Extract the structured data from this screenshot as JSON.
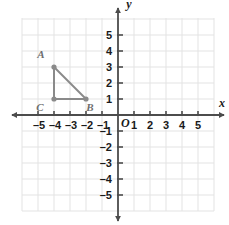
{
  "chart_data": {
    "type": "scatter",
    "title": "",
    "xlabel": "x",
    "ylabel": "y",
    "xlim": [
      -5.8,
      6.1
    ],
    "ylim": [
      -6.1,
      6.3
    ],
    "grid": true,
    "legend": "none",
    "x_ticks": [
      -5,
      -4,
      -3,
      -2,
      -1,
      1,
      2,
      3,
      4,
      5
    ],
    "y_ticks": [
      -5,
      -4,
      -3,
      -2,
      -1,
      1,
      2,
      3,
      4,
      5
    ],
    "x_tick_labels": [
      "–5",
      "–4",
      "–3",
      "–2",
      "–1",
      "1",
      "2",
      "3",
      "4",
      "5"
    ],
    "y_tick_labels": [
      "–5",
      "–4",
      "–3",
      "–2",
      "–1",
      "1",
      "2",
      "3",
      "4",
      "5"
    ],
    "origin_label": "O",
    "points": [
      {
        "name": "A",
        "x": -4,
        "y": 3,
        "label": "A",
        "label_dx": -13,
        "label_dy": -9
      },
      {
        "name": "B",
        "x": -2,
        "y": 1,
        "label": "B",
        "label_dx": 4,
        "label_dy": 12
      },
      {
        "name": "C",
        "x": -4,
        "y": 1,
        "label": "C",
        "label_dx": -14,
        "label_dy": 12
      }
    ],
    "segments": [
      {
        "from": "A",
        "to": "C"
      },
      {
        "from": "C",
        "to": "B"
      },
      {
        "from": "B",
        "to": "A"
      }
    ],
    "shape": "right triangle ABC"
  },
  "colors": {
    "background": "#ffffff",
    "grid": "#e3e3e3",
    "axis": "#4c4c4c",
    "tick_text": "#1a1a1a",
    "figure": "#8a8a8a",
    "point_label": "#6e6e6e"
  },
  "geometry": {
    "origin_px": {
      "x": 118,
      "y": 115
    },
    "unit_px": 16,
    "grid_rect": {
      "left": 22,
      "top": 18,
      "right": 214,
      "bottom": 211
    }
  }
}
